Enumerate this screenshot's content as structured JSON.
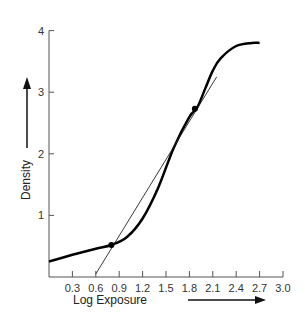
{
  "chart_data": {
    "type": "line",
    "title": "",
    "xlabel": "Log Exposure",
    "ylabel": "Density",
    "xlim": [
      0,
      3.0
    ],
    "ylim": [
      0,
      4
    ],
    "x_ticks": [
      "0.3",
      "0.6",
      "0.9",
      "1.2",
      "1.5",
      "1.8",
      "2.1",
      "2.4",
      "2.7",
      "3.0"
    ],
    "y_ticks": [
      "1",
      "2",
      "3",
      "4"
    ],
    "grid": false,
    "legend": null,
    "series": [
      {
        "name": "Characteristic curve",
        "style": "thick",
        "points": [
          [
            0.0,
            0.25
          ],
          [
            0.3,
            0.36
          ],
          [
            0.6,
            0.46
          ],
          [
            0.8,
            0.52
          ],
          [
            1.0,
            0.65
          ],
          [
            1.2,
            0.95
          ],
          [
            1.4,
            1.45
          ],
          [
            1.6,
            2.1
          ],
          [
            1.8,
            2.6
          ],
          [
            1.9,
            2.75
          ],
          [
            2.0,
            3.05
          ],
          [
            2.1,
            3.35
          ],
          [
            2.2,
            3.55
          ],
          [
            2.4,
            3.75
          ],
          [
            2.6,
            3.8
          ],
          [
            2.7,
            3.8
          ]
        ]
      },
      {
        "name": "Gradient line",
        "style": "thin",
        "points": [
          [
            0.6,
            0.05
          ],
          [
            2.15,
            3.25
          ]
        ]
      }
    ],
    "annotations": [
      {
        "type": "point",
        "x": 0.8,
        "y": 0.52
      },
      {
        "type": "point",
        "x": 1.87,
        "y": 2.73
      }
    ]
  }
}
